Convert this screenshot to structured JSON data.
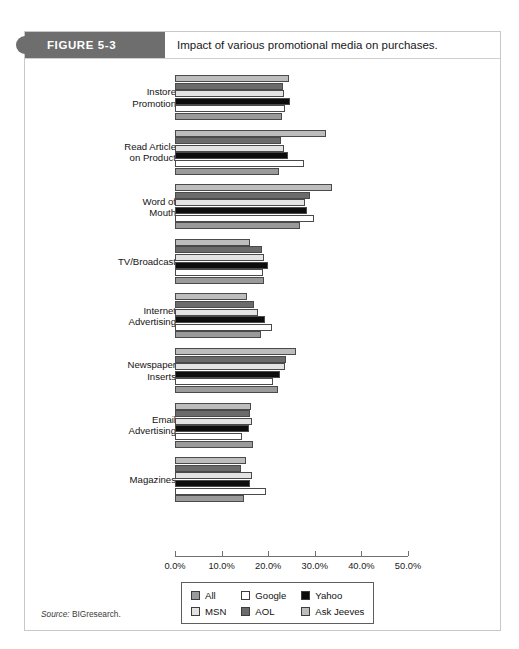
{
  "figure": {
    "tag": "FIGURE 5-3",
    "caption": "Impact of various promotional media on purchases.",
    "source_label": "Source:",
    "source_text": "BIGresearch."
  },
  "legend": {
    "items": [
      {
        "label": "All",
        "color": "#9a9a9a"
      },
      {
        "label": "Google",
        "color": "#ffffff"
      },
      {
        "label": "Yahoo",
        "color": "#0d0d0d"
      },
      {
        "label": "MSN",
        "color": "#e3e3e3"
      },
      {
        "label": "AOL",
        "color": "#6b6b6b"
      },
      {
        "label": "Ask Jeeves",
        "color": "#bdbdbd"
      }
    ]
  },
  "chart_data": {
    "type": "bar",
    "orientation": "horizontal",
    "title": "Impact of various promotional media on purchases.",
    "xlabel": "",
    "ylabel": "",
    "xlim": [
      0,
      50
    ],
    "xticks": [
      0,
      10,
      20,
      30,
      40,
      50
    ],
    "xtick_labels": [
      "0.0%",
      "10.0%",
      "20.0%",
      "30.0%",
      "40.0%",
      "50.0%"
    ],
    "grid": false,
    "legend_position": "bottom",
    "value_unit": "%",
    "categories": [
      "Instore\nPromotion",
      "Read Article\non Product",
      "Word of\nMouth",
      "TV/Broadcast",
      "Internet\nAdvertising",
      "Newspaper\nInserts",
      "Email\nAdvertising",
      "Magazines"
    ],
    "series": [
      {
        "name": "All",
        "color": "#9a9a9a",
        "values": [
          23.0,
          22.3,
          26.8,
          19.1,
          18.5,
          22.0,
          16.8,
          14.8
        ]
      },
      {
        "name": "Google",
        "color": "#ffffff",
        "values": [
          23.7,
          27.6,
          29.8,
          18.8,
          20.8,
          21.0,
          14.3,
          19.5
        ]
      },
      {
        "name": "Yahoo",
        "color": "#0d0d0d",
        "values": [
          24.6,
          24.3,
          28.4,
          20.0,
          19.4,
          22.6,
          15.8,
          16.2
        ]
      },
      {
        "name": "MSN",
        "color": "#e3e3e3",
        "values": [
          23.4,
          23.4,
          27.9,
          19.2,
          17.9,
          23.5,
          16.5,
          16.6
        ]
      },
      {
        "name": "AOL",
        "color": "#6b6b6b",
        "values": [
          23.1,
          22.8,
          29.0,
          18.6,
          17.0,
          23.9,
          16.0,
          14.1
        ]
      },
      {
        "name": "Ask Jeeves",
        "color": "#bdbdbd",
        "values": [
          24.4,
          32.4,
          33.7,
          16.0,
          15.4,
          26.0,
          16.4,
          15.3
        ]
      }
    ]
  }
}
